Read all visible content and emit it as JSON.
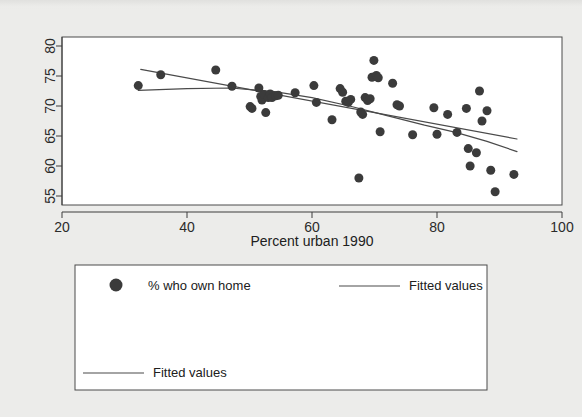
{
  "figure": {
    "background_color": "#ececea",
    "plot_background_color": "#ffffff",
    "frame_color": "#4a4a4a"
  },
  "chart_data": {
    "type": "scatter",
    "title": "",
    "subtitle": "",
    "xlabel": "Percent urban 1990",
    "ylabel": "",
    "xlim": [
      20,
      100
    ],
    "ylim": [
      53.5,
      81.5
    ],
    "xticks": [
      20,
      40,
      60,
      80,
      100
    ],
    "yticks": [
      55,
      60,
      65,
      70,
      75,
      80
    ],
    "xtick_labels": [
      "20",
      "40",
      "60",
      "80",
      "100"
    ],
    "ytick_labels": [
      "55",
      "60",
      "65",
      "70",
      "75",
      "80"
    ],
    "grid": false,
    "ytick_label_rotation": 90,
    "marker_color": "#3b3b3b",
    "marker_size": 9,
    "line_color": "#4a4a4a",
    "legend_position": "below-axes-box",
    "series": [
      {
        "name": "% who own home",
        "type": "scatter",
        "points": [
          [
            32.2,
            73.4
          ],
          [
            35.8,
            75.2
          ],
          [
            44.6,
            76.0
          ],
          [
            47.2,
            73.3
          ],
          [
            50.1,
            69.9
          ],
          [
            50.4,
            69.6
          ],
          [
            51.5,
            73.0
          ],
          [
            51.8,
            71.6
          ],
          [
            52.0,
            71.0
          ],
          [
            52.3,
            71.9
          ],
          [
            52.6,
            68.9
          ],
          [
            53.0,
            71.4
          ],
          [
            53.3,
            72.0
          ],
          [
            53.6,
            71.4
          ],
          [
            54.2,
            71.7
          ],
          [
            54.6,
            71.8
          ],
          [
            57.3,
            72.2
          ],
          [
            60.3,
            73.4
          ],
          [
            60.7,
            70.6
          ],
          [
            63.2,
            67.7
          ],
          [
            64.5,
            72.9
          ],
          [
            64.9,
            72.3
          ],
          [
            65.4,
            70.8
          ],
          [
            65.8,
            70.6
          ],
          [
            66.2,
            71.1
          ],
          [
            67.5,
            58.0
          ],
          [
            67.8,
            69.0
          ],
          [
            68.1,
            68.6
          ],
          [
            68.5,
            71.4
          ],
          [
            68.9,
            70.9
          ],
          [
            69.3,
            71.2
          ],
          [
            69.6,
            74.8
          ],
          [
            69.9,
            77.6
          ],
          [
            70.3,
            75.1
          ],
          [
            70.6,
            74.7
          ],
          [
            70.9,
            65.7
          ],
          [
            72.9,
            73.8
          ],
          [
            73.6,
            70.2
          ],
          [
            74.0,
            70.0
          ],
          [
            76.1,
            65.2
          ],
          [
            79.5,
            69.7
          ],
          [
            80.0,
            65.3
          ],
          [
            81.7,
            68.6
          ],
          [
            83.2,
            65.6
          ],
          [
            84.7,
            69.6
          ],
          [
            85.0,
            62.9
          ],
          [
            85.3,
            60.0
          ],
          [
            86.3,
            62.2
          ],
          [
            86.8,
            72.5
          ],
          [
            87.2,
            67.5
          ],
          [
            88.0,
            69.2
          ],
          [
            88.6,
            59.3
          ],
          [
            89.3,
            55.7
          ],
          [
            92.3,
            58.6
          ]
        ]
      },
      {
        "name": "Fitted values",
        "type": "line",
        "fit": "linear",
        "points": [
          [
            32.6,
            76.1
          ],
          [
            92.8,
            64.5
          ]
        ]
      },
      {
        "name": "Fitted values",
        "type": "line",
        "fit": "quadratic",
        "points": [
          [
            32.2,
            72.6
          ],
          [
            40.0,
            72.9
          ],
          [
            47.0,
            73.0
          ],
          [
            54.0,
            72.4
          ],
          [
            60.0,
            71.4
          ],
          [
            66.0,
            70.0
          ],
          [
            72.0,
            68.4
          ],
          [
            78.0,
            66.8
          ],
          [
            83.0,
            65.6
          ],
          [
            88.0,
            64.1
          ],
          [
            92.8,
            62.4
          ]
        ]
      }
    ]
  },
  "legend": {
    "entries": [
      {
        "label": "% who own home",
        "marker": "dot-marker",
        "row": 1,
        "column": "left"
      },
      {
        "label": "Fitted values",
        "marker": "line-marker",
        "row": 1,
        "column": "right"
      },
      {
        "label": "Fitted values",
        "marker": "line-marker",
        "row": 2,
        "column": "left"
      }
    ]
  }
}
